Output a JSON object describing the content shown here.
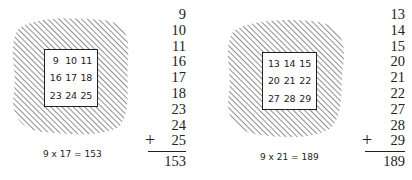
{
  "panels": [
    {
      "grid": [
        "9",
        "10",
        "11",
        "16",
        "17",
        "18",
        "23",
        "24",
        "25"
      ],
      "caption": "9 x 17 = 153",
      "column": [
        "9",
        "10",
        "11",
        "16",
        "17",
        "18",
        "23",
        "24",
        "25"
      ],
      "plus": "+",
      "sum": "153"
    },
    {
      "grid": [
        "13",
        "14",
        "15",
        "20",
        "21",
        "22",
        "27",
        "28",
        "29"
      ],
      "caption": "9 x 21 = 189",
      "column": [
        "13",
        "14",
        "15",
        "20",
        "21",
        "22",
        "27",
        "28",
        "29"
      ],
      "plus": "+",
      "sum": "189"
    }
  ],
  "colors": {
    "ink": "#222222",
    "background": "#ffffff"
  }
}
